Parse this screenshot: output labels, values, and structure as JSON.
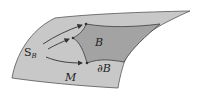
{
  "diagram": {
    "labels": {
      "source": "S",
      "source_sub": "B",
      "region": "B",
      "boundary": "∂B",
      "manifold": "M"
    },
    "colors": {
      "manifold_fill": "#c8c8c8",
      "region_fill": "#a3a3a3",
      "edge": "#4a4a4a",
      "arrow": "#333333"
    }
  }
}
